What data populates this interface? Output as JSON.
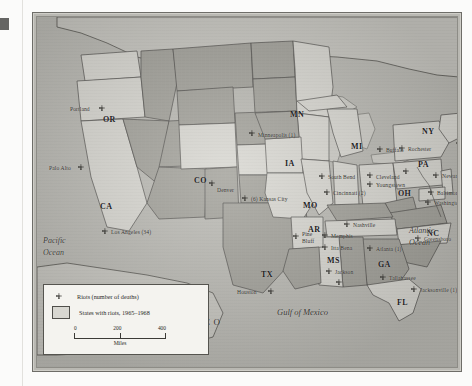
{
  "figure": {
    "type": "thematic-map"
  },
  "legend": {
    "marker_label": "Riots (number of deaths)",
    "swatch_label": "States with riots, 1965–1968",
    "scale": {
      "ticks": [
        "0",
        "200",
        "400"
      ],
      "unit": "Miles"
    }
  },
  "ocean_labels": {
    "pacific": "Pacific\nOcean",
    "pacific_line1": "Pacific",
    "pacific_line2": "Ocean",
    "atlantic_line1": "Atlantic",
    "atlantic_line2": "Ocean",
    "gulf": "Gulf of Mexico",
    "mexico": "MEXICO"
  },
  "state_labels": [
    {
      "abbr": "OR",
      "x": 66,
      "y": 98
    },
    {
      "abbr": "CA",
      "x": 63,
      "y": 185
    },
    {
      "abbr": "CO",
      "x": 157,
      "y": 159
    },
    {
      "abbr": "MN",
      "x": 253,
      "y": 93
    },
    {
      "abbr": "IA",
      "x": 248,
      "y": 142
    },
    {
      "abbr": "MO",
      "x": 266,
      "y": 184
    },
    {
      "abbr": "MI",
      "x": 314,
      "y": 125
    },
    {
      "abbr": "OH",
      "x": 361,
      "y": 172
    },
    {
      "abbr": "PA",
      "x": 381,
      "y": 143
    },
    {
      "abbr": "NY",
      "x": 385,
      "y": 110
    },
    {
      "abbr": "NC",
      "x": 390,
      "y": 212
    },
    {
      "abbr": "TX",
      "x": 224,
      "y": 253
    },
    {
      "abbr": "AR",
      "x": 271,
      "y": 208
    },
    {
      "abbr": "MS",
      "x": 290,
      "y": 239
    },
    {
      "abbr": "GA",
      "x": 341,
      "y": 243
    },
    {
      "abbr": "FL",
      "x": 360,
      "y": 281
    }
  ],
  "cities": [
    {
      "name": "Portland",
      "mx": 67,
      "my": 89,
      "anchor": "right"
    },
    {
      "name": "Palo Alto",
      "mx": 46,
      "my": 148,
      "anchor": "right"
    },
    {
      "name": "Los Angeles (34)",
      "mx": 68,
      "my": 212,
      "anchor": "left"
    },
    {
      "name": "Denver",
      "mx": 174,
      "my": 170,
      "anchor": "below"
    },
    {
      "name": "Minneapolis (1)",
      "mx": 215,
      "my": 115,
      "anchor": "left"
    },
    {
      "name": "(6) Kansas City",
      "mx": 208,
      "my": 179,
      "anchor": "left"
    },
    {
      "name": "South Bend",
      "mx": 285,
      "my": 157,
      "anchor": "left"
    },
    {
      "name": "Cincinnati (2)",
      "mx": 290,
      "my": 173,
      "anchor": "left"
    },
    {
      "name": "Cleveland",
      "mx": 333,
      "my": 157,
      "anchor": "left"
    },
    {
      "name": "Youngstown",
      "mx": 333,
      "my": 165,
      "anchor": "left"
    },
    {
      "name": "Buffalo",
      "mx": 343,
      "my": 130,
      "anchor": "left"
    },
    {
      "name": "Rochester",
      "mx": 365,
      "my": 129,
      "anchor": "left"
    },
    {
      "name": "Boston",
      "mx": 422,
      "my": 124,
      "anchor": "left"
    },
    {
      "name": "Newark (26)",
      "mx": 399,
      "my": 156,
      "anchor": "left"
    },
    {
      "name": "Baltimore (6)",
      "mx": 394,
      "my": 173,
      "anchor": "left"
    },
    {
      "name": "Washington DC (10)",
      "mx": 391,
      "my": 183,
      "anchor": "left"
    },
    {
      "name": "Greensboro",
      "mx": 381,
      "my": 219,
      "anchor": "left"
    },
    {
      "name": "Nashville",
      "mx": 310,
      "my": 205,
      "anchor": "left"
    },
    {
      "name": "Memphis",
      "mx": 288,
      "my": 216,
      "anchor": "left"
    },
    {
      "name": "Pine",
      "mx": 259,
      "my": 214,
      "anchor": "left"
    },
    {
      "name": "Bluff",
      "mx": 259,
      "my": 221,
      "anchor": "left"
    },
    {
      "name": "Itta Bena",
      "mx": 288,
      "my": 228,
      "anchor": "left"
    },
    {
      "name": "Jackson",
      "mx": 292,
      "my": 252,
      "anchor": "left"
    },
    {
      "name": "Atlanta (1)",
      "mx": 333,
      "my": 229,
      "anchor": "left"
    },
    {
      "name": "Tallahassee",
      "mx": 346,
      "my": 258,
      "anchor": "left"
    },
    {
      "name": "Jacksonville (1)",
      "mx": 377,
      "my": 270,
      "anchor": "left"
    },
    {
      "name": "Houston",
      "mx": 234,
      "my": 272,
      "anchor": "right"
    }
  ],
  "riot_markers": [
    {
      "mx": 62,
      "my": 88
    },
    {
      "mx": 41,
      "my": 147
    },
    {
      "mx": 65,
      "my": 211
    },
    {
      "mx": 172,
      "my": 163
    },
    {
      "mx": 212,
      "my": 113
    },
    {
      "mx": 205,
      "my": 178
    },
    {
      "mx": 282,
      "my": 156
    },
    {
      "mx": 287,
      "my": 172
    },
    {
      "mx": 330,
      "my": 155
    },
    {
      "mx": 330,
      "my": 164
    },
    {
      "mx": 340,
      "my": 129
    },
    {
      "mx": 362,
      "my": 128
    },
    {
      "mx": 419,
      "my": 123
    },
    {
      "mx": 396,
      "my": 155
    },
    {
      "mx": 391,
      "my": 172
    },
    {
      "mx": 388,
      "my": 182
    },
    {
      "mx": 378,
      "my": 218
    },
    {
      "mx": 307,
      "my": 204
    },
    {
      "mx": 285,
      "my": 215
    },
    {
      "mx": 256,
      "my": 216
    },
    {
      "mx": 285,
      "my": 227
    },
    {
      "mx": 289,
      "my": 251
    },
    {
      "mx": 330,
      "my": 228
    },
    {
      "mx": 343,
      "my": 257
    },
    {
      "mx": 374,
      "my": 269
    },
    {
      "mx": 231,
      "my": 271
    },
    {
      "mx": 366,
      "my": 151
    },
    {
      "mx": 299,
      "my": 262
    }
  ],
  "states_with_riots": [
    "OR",
    "CA",
    "CO",
    "MN",
    "MO",
    "OH",
    "PA",
    "NY",
    "NJ",
    "MD",
    "DC",
    "MI",
    "IN",
    "TN",
    "MS",
    "FL",
    "NC",
    "WI",
    "MA",
    "DE",
    "KS"
  ]
}
